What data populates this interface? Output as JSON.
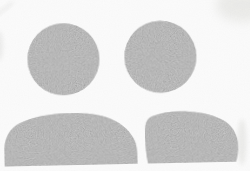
{
  "canvas": {
    "width": "250",
    "height": "171",
    "background_color": "#fdfdfd"
  },
  "icon": {
    "name": "two-users-silhouette",
    "base_fill": "#b4b4b4",
    "grain_opacity": "0.5",
    "tilt": "slight counterclockwise",
    "parts": {
      "left_head": "left-user-head",
      "right_head": "right-user-head",
      "left_torso": "left-user-torso",
      "right_torso": "right-user-torso"
    }
  },
  "artifacts": {
    "corner_haze_color": "#e2e2de",
    "edge_streak_color": "#dcdcda",
    "torso_shadow_color": "#e0e0dd",
    "photo_grain_opacity": "0.045"
  }
}
